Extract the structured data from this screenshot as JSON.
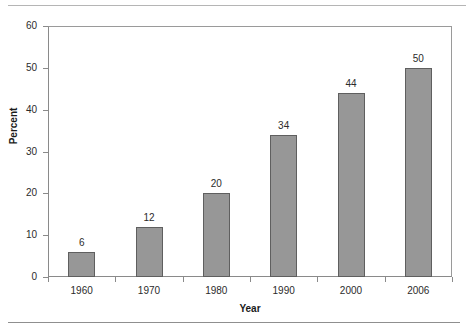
{
  "chart_data": {
    "type": "bar",
    "title": "",
    "subtitle": "",
    "xlabel": "Year",
    "ylabel": "Percent",
    "categories": [
      "1960",
      "1970",
      "1980",
      "1990",
      "2000",
      "2006"
    ],
    "values": [
      6,
      12,
      20,
      34,
      44,
      50
    ],
    "data_labels": [
      "6",
      "12",
      "20",
      "34",
      "44",
      "50"
    ],
    "ylim": [
      0,
      60
    ],
    "y_ticks": [
      0,
      10,
      20,
      30,
      40,
      50,
      60
    ],
    "y_tick_labels": [
      "0",
      "10",
      "20",
      "30",
      "40",
      "50",
      "60"
    ],
    "grid": false,
    "legend": "none",
    "series": [
      {
        "name": "Percent",
        "values": [
          6,
          12,
          20,
          34,
          44,
          50
        ],
        "color": "#979797",
        "edge_color": "#5f5f5f"
      }
    ],
    "annotations": []
  },
  "colors": {
    "bar_fill": "#979797",
    "bar_edge": "#5f5f5f",
    "axis": "#8a8a8a",
    "text": "#2b2b2b",
    "background": "#ffffff",
    "rule": "#9c9c9c"
  }
}
